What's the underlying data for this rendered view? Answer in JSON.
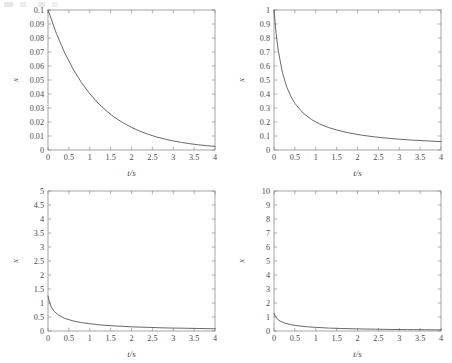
{
  "figure": {
    "background_color": "#ffffff",
    "line_color": "#4e4e4e",
    "axis_color": "#8e8e8e",
    "text_color": "#4a4a4a",
    "layout": "2x2 grid of plots"
  },
  "chart_data": [
    {
      "type": "line",
      "position": "top-left",
      "title": "",
      "xlabel": "t/s",
      "ylabel": "x",
      "xlim": [
        0,
        4
      ],
      "ylim": [
        0,
        0.1
      ],
      "grid": false,
      "legend": null,
      "xticks": [
        0,
        0.5,
        1,
        1.5,
        2,
        2.5,
        3,
        3.5,
        4
      ],
      "xticklabels": [
        "0",
        "0.5",
        "1",
        "1.5",
        "2",
        "2.5",
        "3",
        "3.5",
        "4"
      ],
      "yticks": [
        0,
        0.01,
        0.02,
        0.03,
        0.04,
        0.05,
        0.06,
        0.07,
        0.08,
        0.09,
        0.1
      ],
      "yticklabels": [
        "0",
        "0.01",
        "0.02",
        "0.03",
        "0.04",
        "0.05",
        "0.06",
        "0.07",
        "0.08",
        "0.09",
        "0.1"
      ],
      "x": [
        0,
        0.2,
        0.4,
        0.6,
        0.8,
        1.0,
        1.2,
        1.4,
        1.6,
        1.8,
        2.0,
        2.2,
        2.4,
        2.6,
        2.8,
        3.0,
        3.2,
        3.4,
        3.6,
        3.8,
        4.0
      ],
      "values": [
        0.1,
        0.0833,
        0.0694,
        0.0579,
        0.0482,
        0.0402,
        0.0335,
        0.0279,
        0.0232,
        0.0194,
        0.0161,
        0.0135,
        0.0112,
        0.0093,
        0.0078,
        0.0065,
        0.0054,
        0.0045,
        0.0037,
        0.0031,
        0.0026
      ]
    },
    {
      "type": "line",
      "position": "top-right",
      "title": "",
      "xlabel": "t/s",
      "ylabel": "x",
      "xlim": [
        0,
        4
      ],
      "ylim": [
        0,
        1
      ],
      "grid": false,
      "legend": null,
      "xticks": [
        0,
        0.5,
        1,
        1.5,
        2,
        2.5,
        3,
        3.5,
        4
      ],
      "xticklabels": [
        "0",
        "0.5",
        "1",
        "1.5",
        "2",
        "2.5",
        "3",
        "3.5",
        "4"
      ],
      "yticks": [
        0,
        0.1,
        0.2,
        0.3,
        0.4,
        0.5,
        0.6,
        0.7,
        0.8,
        0.9,
        1
      ],
      "yticklabels": [
        "0",
        "0.1",
        "0.2",
        "0.3",
        "0.4",
        "0.5",
        "0.6",
        "0.7",
        "0.8",
        "0.9",
        "1"
      ],
      "x": [
        0,
        0.05,
        0.1,
        0.2,
        0.3,
        0.4,
        0.5,
        0.7,
        0.9,
        1.1,
        1.3,
        1.5,
        1.8,
        2.1,
        2.4,
        2.7,
        3.0,
        3.3,
        3.6,
        4.0
      ],
      "values": [
        1.0,
        0.833,
        0.714,
        0.555,
        0.454,
        0.385,
        0.333,
        0.263,
        0.217,
        0.185,
        0.161,
        0.143,
        0.122,
        0.106,
        0.094,
        0.085,
        0.077,
        0.071,
        0.066,
        0.06
      ]
    },
    {
      "type": "line",
      "position": "bottom-left",
      "title": "",
      "xlabel": "t/s",
      "ylabel": "x",
      "xlim": [
        0,
        4
      ],
      "ylim": [
        0,
        5
      ],
      "grid": false,
      "legend": null,
      "xticks": [
        0,
        0.5,
        1,
        1.5,
        2,
        2.5,
        3,
        3.5,
        4
      ],
      "xticklabels": [
        "0",
        "0.5",
        "1",
        "1.5",
        "2",
        "2.5",
        "3",
        "3.5",
        "4"
      ],
      "yticks": [
        0,
        0.5,
        1,
        1.5,
        2,
        2.5,
        3,
        3.5,
        4,
        4.5,
        5
      ],
      "yticklabels": [
        "0",
        "0.5",
        "1",
        "1.5",
        "2",
        "2.5",
        "3",
        "3.5",
        "4",
        "4.5",
        "5"
      ],
      "x": [
        0,
        0.03,
        0.08,
        0.15,
        0.25,
        0.4,
        0.6,
        0.8,
        1.0,
        1.3,
        1.6,
        2.0,
        2.4,
        2.8,
        3.2,
        3.6,
        4.0
      ],
      "values": [
        1.25,
        1.05,
        0.85,
        0.7,
        0.57,
        0.45,
        0.36,
        0.3,
        0.26,
        0.21,
        0.18,
        0.15,
        0.13,
        0.11,
        0.1,
        0.09,
        0.08
      ]
    },
    {
      "type": "line",
      "position": "bottom-right",
      "title": "",
      "xlabel": "t/s",
      "ylabel": "x",
      "xlim": [
        0,
        4
      ],
      "ylim": [
        0,
        10
      ],
      "grid": false,
      "legend": null,
      "xticks": [
        0,
        0.5,
        1,
        1.5,
        2,
        2.5,
        3,
        3.5,
        4
      ],
      "xticklabels": [
        "0",
        "0.5",
        "1",
        "1.5",
        "2",
        "2.5",
        "3",
        "3.5",
        "4"
      ],
      "yticks": [
        0,
        1,
        2,
        3,
        4,
        5,
        6,
        7,
        8,
        9,
        10
      ],
      "yticklabels": [
        "0",
        "1",
        "2",
        "3",
        "4",
        "5",
        "6",
        "7",
        "8",
        "9",
        "10"
      ],
      "x": [
        0,
        0.03,
        0.08,
        0.15,
        0.25,
        0.4,
        0.6,
        0.8,
        1.0,
        1.3,
        1.6,
        2.0,
        2.4,
        2.8,
        3.2,
        3.6,
        4.0
      ],
      "values": [
        1.25,
        1.05,
        0.85,
        0.7,
        0.57,
        0.45,
        0.36,
        0.3,
        0.26,
        0.21,
        0.18,
        0.15,
        0.13,
        0.11,
        0.1,
        0.09,
        0.08
      ]
    }
  ]
}
